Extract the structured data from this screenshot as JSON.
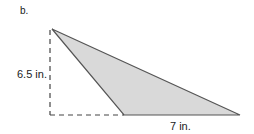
{
  "figure": {
    "label": "b.",
    "shape": "obtuse-triangle",
    "height_label": "6.5 in.",
    "base_label": "7 in.",
    "fill_color": "#d9d9d9",
    "stroke_color": "#555555",
    "dashed_color": "#444444",
    "vertices": {
      "apex": [
        52,
        29
      ],
      "base_left": [
        124,
        115
      ],
      "base_right": [
        240,
        115
      ],
      "height_foot": [
        50,
        115
      ]
    }
  }
}
